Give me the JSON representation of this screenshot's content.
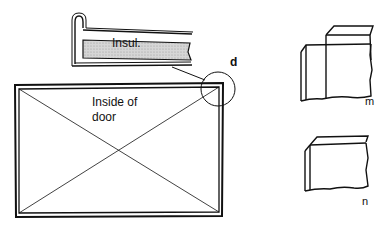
{
  "diagram": {
    "type": "technical line drawing",
    "labels": {
      "insulation": "Insul.",
      "door_line1": "Inside of",
      "door_line2": "door",
      "detail_circle": "d",
      "view_m": "m",
      "view_n": "n"
    },
    "colors": {
      "line": "#111111",
      "insulation_fill": "#c8c8c8",
      "background": "#ffffff"
    }
  }
}
